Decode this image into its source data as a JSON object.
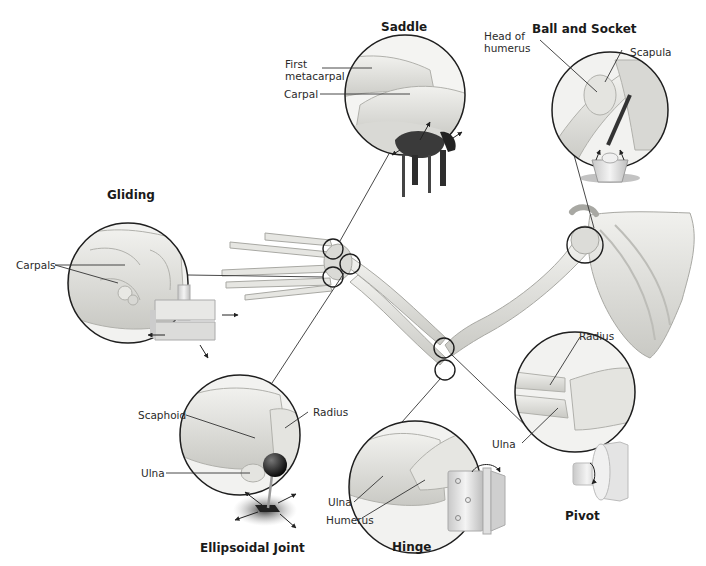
{
  "diagram": {
    "joints": [
      {
        "id": "saddle",
        "title": "Saddle",
        "labels": [
          "First metacarpal",
          "Carpal"
        ],
        "model": "saddle"
      },
      {
        "id": "ball-socket",
        "title": "Ball and Socket",
        "labels": [
          "Head of humerus",
          "Scapula"
        ],
        "model": "ball-in-cup"
      },
      {
        "id": "gliding",
        "title": "Gliding",
        "labels": [
          "Carpals"
        ],
        "model": "sliding-blocks"
      },
      {
        "id": "ellipsoidal",
        "title": "Ellipsoidal Joint",
        "labels": [
          "Scaphoid",
          "Radius",
          "Ulna"
        ],
        "model": "joystick"
      },
      {
        "id": "hinge",
        "title": "Hinge",
        "labels": [
          "Ulna",
          "Humerus"
        ],
        "model": "door-hinge"
      },
      {
        "id": "pivot",
        "title": "Pivot",
        "labels": [
          "Radius",
          "Ulna"
        ],
        "model": "axle-wheel"
      }
    ],
    "titles": {
      "saddle": "Saddle",
      "ball_socket": "Ball and Socket",
      "gliding": "Gliding",
      "ellipsoidal": "Ellipsoidal Joint",
      "hinge": "Hinge",
      "pivot": "Pivot"
    },
    "labels": {
      "first_metacarpal_1": "First",
      "first_metacarpal_2": "metacarpal",
      "carpal": "Carpal",
      "head_of_humerus_1": "Head of",
      "head_of_humerus_2": "humerus",
      "scapula": "Scapula",
      "carpals": "Carpals",
      "scaphoid": "Scaphoid",
      "radius_ellipsoidal": "Radius",
      "ulna_ellipsoidal": "Ulna",
      "ulna_hinge": "Ulna",
      "humerus_hinge": "Humerus",
      "radius_pivot": "Radius",
      "ulna_pivot": "Ulna"
    },
    "colors": {
      "bone": "#e4e4e0",
      "bone_shadow": "#b9b9b4",
      "outline": "#1e1e1e",
      "saddle_leather": "#3a3a3a",
      "ball": "#111111",
      "metal": "#d6d6d6"
    }
  }
}
